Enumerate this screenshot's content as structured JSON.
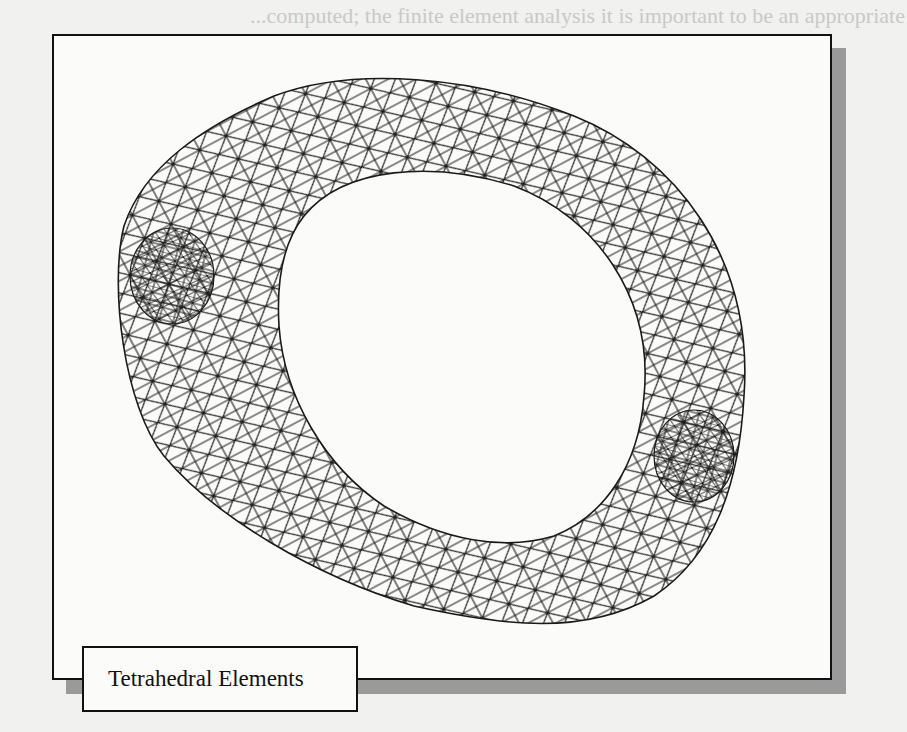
{
  "background_text_lines": [
    "...computed; the finite element analysis it is important to be an appropriate",
    "...analysis, cost requirements and the problem and as a means of",
    "...element analysis tool.",
    "...linear static analysis ... the ... used ...",
    "...element formulation",
    "...operations ... the element model",
    "...model ... finite elements",
    "...associated ... and the ... of the system",
    "...the boundary ... supported",
    "...describe the ... that are applied to the system",
    "...analysis formulation",
    "...generate stiffness matrix ... element",
    "...assemble the individual stiffness matrices to obtain the overall"
  ],
  "figure": {
    "caption": "Tetrahedral Elements"
  },
  "colors": {
    "frame_border": "#111111",
    "shadow": "#9a9a9a",
    "mesh_line": "#1a1a1a",
    "page_background": "#f1f1ef"
  }
}
